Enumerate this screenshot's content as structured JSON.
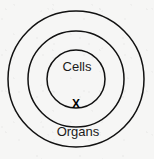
{
  "diagram": {
    "type": "concentric-circles",
    "background_color": "#f6f6f5",
    "stroke_color": "#111111",
    "text_color": "#1a1a1a",
    "center": {
      "x": 76,
      "y": 79
    },
    "rings": [
      {
        "id": "outer-ring",
        "name": "organs",
        "label": "Organs",
        "radius": 68,
        "label_position": {
          "x": 78,
          "y": 133
        }
      },
      {
        "id": "middle-ring",
        "name": "middle",
        "label": "X",
        "radius": 48,
        "label_position": {
          "x": 76,
          "y": 104
        }
      },
      {
        "id": "inner-ring",
        "name": "cells",
        "label": "Cells",
        "radius": 29,
        "label_position": {
          "x": 77,
          "y": 68
        }
      }
    ],
    "labels": {
      "inner": "Cells",
      "middle_marker": "X",
      "outer": "Organs"
    }
  }
}
